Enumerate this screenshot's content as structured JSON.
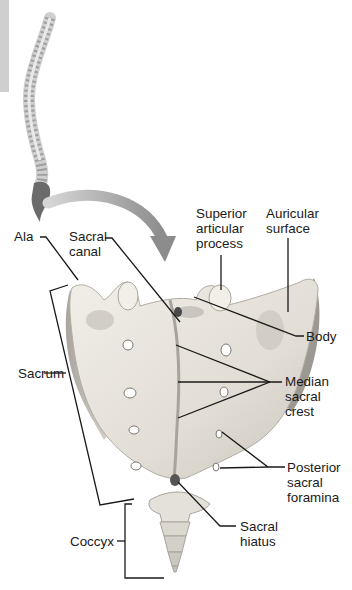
{
  "figure": {
    "colors": {
      "bone": "#e9e6df",
      "bone_shadow": "#b9b5ad",
      "bone_dark": "#8f8b84",
      "spine_sacrum": "#6b6b6b",
      "arrow": "#9a9a9a",
      "leader_line": "#1a1a1a",
      "side_tab": "#cfcfcf"
    }
  },
  "labels": {
    "ala": {
      "lines": [
        "Ala"
      ]
    },
    "sacral_canal": {
      "lines": [
        "Sacral",
        "canal"
      ]
    },
    "superior_articular_process": {
      "lines": [
        "Superior",
        "articular",
        "process"
      ]
    },
    "auricular_surface": {
      "lines": [
        "Auricular",
        "surface"
      ]
    },
    "body": {
      "lines": [
        "Body"
      ]
    },
    "median_sacral_crest": {
      "lines": [
        "Median",
        "sacral",
        "crest"
      ]
    },
    "sacrum": {
      "lines": [
        "Sacrum"
      ]
    },
    "posterior_sacral_foramina": {
      "lines": [
        "Posterior",
        "sacral",
        "foramina"
      ]
    },
    "sacral_hiatus": {
      "lines": [
        "Sacral",
        "hiatus"
      ]
    },
    "coccyx": {
      "lines": [
        "Coccyx"
      ]
    }
  }
}
